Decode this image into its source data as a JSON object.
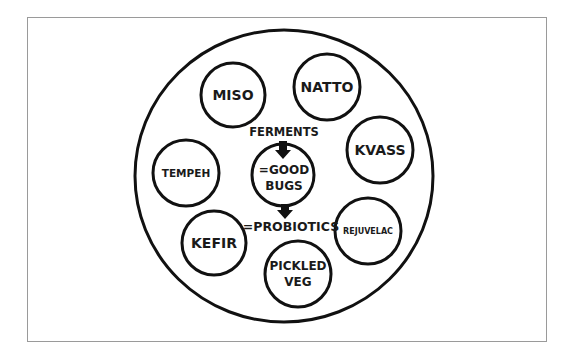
{
  "diagram": {
    "outer_circle": {
      "cx": 284,
      "cy": 176,
      "rx": 149,
      "ry": 146
    },
    "items": [
      {
        "label": "MISO",
        "lines": [
          "MISO"
        ],
        "cx": 233,
        "cy": 95,
        "r": 32,
        "font": 14
      },
      {
        "label": "NATTO",
        "lines": [
          "NATTO"
        ],
        "cx": 327,
        "cy": 87,
        "r": 33,
        "font": 14
      },
      {
        "label": "KVASS",
        "lines": [
          "KVASS"
        ],
        "cx": 380,
        "cy": 150,
        "r": 33,
        "font": 14
      },
      {
        "label": "REJUVELAC",
        "lines": [
          "REJUVELAC"
        ],
        "cx": 368,
        "cy": 231,
        "r": 33,
        "font": 8
      },
      {
        "label": "PICKLED VEG",
        "lines": [
          "PICKLED",
          "VEG"
        ],
        "cx": 298,
        "cy": 274,
        "r": 33,
        "font": 12
      },
      {
        "label": "KEFIR",
        "lines": [
          "KEFIR"
        ],
        "cx": 214,
        "cy": 243,
        "r": 32,
        "font": 14
      },
      {
        "label": "TEMPEH",
        "lines": [
          "TEMPEH"
        ],
        "cx": 186,
        "cy": 173,
        "r": 33,
        "font": 10.5
      }
    ],
    "center": {
      "top_label": "FERMENTS",
      "circle_lines": [
        "=GOOD",
        "BUGS"
      ],
      "bottom_label": "=PROBIOTICS",
      "cx": 283,
      "cy": 175,
      "r": 31
    },
    "colors": {
      "stroke": "#111111",
      "text": "#1a1a1a",
      "frame_border": "#9a9a9a"
    }
  }
}
